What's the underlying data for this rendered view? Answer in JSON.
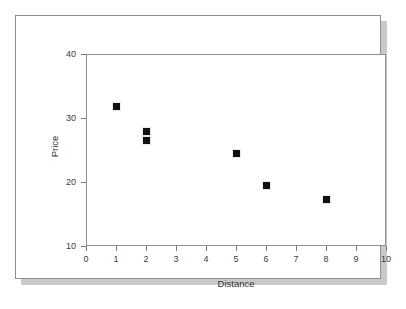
{
  "chart_data": {
    "type": "scatter",
    "title": "",
    "xlabel": "Distance",
    "ylabel": "Price",
    "xlim": [
      0,
      10
    ],
    "ylim": [
      10,
      40
    ],
    "xticks": [
      "0",
      "1",
      "2",
      "3",
      "4",
      "5",
      "6",
      "7",
      "8",
      "9",
      "10"
    ],
    "yticks": [
      "10",
      "20",
      "30",
      "40"
    ],
    "grid": false,
    "legend": null,
    "marker": "filled-square",
    "marker_color": "#111111",
    "x": [
      1,
      2,
      2,
      5,
      6,
      8
    ],
    "y": [
      31.9,
      28.0,
      26.6,
      24.6,
      19.5,
      17.3
    ],
    "points": [
      {
        "x": 1,
        "y": 31.9
      },
      {
        "x": 2,
        "y": 28.0
      },
      {
        "x": 2,
        "y": 26.6
      },
      {
        "x": 5,
        "y": 24.6
      },
      {
        "x": 6,
        "y": 19.5
      },
      {
        "x": 8,
        "y": 17.3
      }
    ]
  },
  "figure": {
    "border_color": "#8e8e8e",
    "shadow_color": "#c9c9c9",
    "background": "#ffffff",
    "axis_color": "#909090"
  }
}
